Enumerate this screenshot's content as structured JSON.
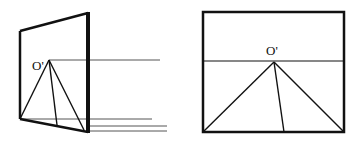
{
  "figures": [
    {
      "id": "perspective-view",
      "description": "Tilted picture plane seen in perspective, with apex O' and ray lines",
      "label": "O'",
      "frame": {
        "points": [
          [
            20,
            31
          ],
          [
            88,
            13
          ],
          [
            88,
            132
          ],
          [
            20,
            119
          ]
        ]
      },
      "apex": [
        49,
        60
      ],
      "rays": [
        [
          20,
          119
        ],
        [
          57,
          125
        ],
        [
          84,
          130
        ]
      ],
      "horizon_ray": {
        "from": [
          49,
          60
        ],
        "to": [
          160,
          60
        ]
      },
      "ground_lines": [
        {
          "from": [
            20,
            119
          ],
          "to": [
            152,
            119
          ]
        },
        {
          "from": [
            88,
            126
          ],
          "to": [
            167,
            126
          ]
        },
        {
          "from": [
            88,
            131
          ],
          "to": [
            167,
            131
          ]
        }
      ]
    },
    {
      "id": "front-view",
      "description": "Picture plane seen head-on with horizon line and apex O'",
      "label": "O'",
      "frame": {
        "x": 203,
        "y": 12,
        "width": 141,
        "height": 120
      },
      "horizon_y": 61,
      "apex": [
        274,
        62
      ],
      "rays": [
        [
          203,
          132
        ],
        [
          284,
          132
        ],
        [
          344,
          132
        ]
      ]
    }
  ],
  "colors": {
    "stroke": "#111111",
    "background": "#ffffff"
  }
}
